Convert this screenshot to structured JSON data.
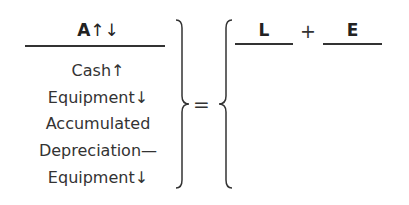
{
  "assets": {
    "header_letter": "A",
    "header_arrows": "↑↓",
    "items": [
      "Cash↑",
      "Equipment↓",
      "Accumulated",
      "Depreciation—",
      "Equipment↓"
    ]
  },
  "equals": "=",
  "liabilities": {
    "header": "L"
  },
  "plus": "+",
  "equity": {
    "header": "E"
  }
}
